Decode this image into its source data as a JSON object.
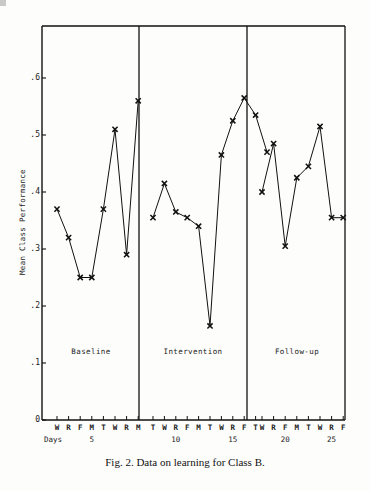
{
  "figure": {
    "caption": "Fig. 2.  Data on learning for Class B.",
    "y_axis_title": "Mean Class Performance",
    "days_label": "Days"
  },
  "chart_data": {
    "type": "line",
    "title": "",
    "xlabel": "Days",
    "ylabel": "Mean Class Performance",
    "ylim": [
      0,
      0.65
    ],
    "yticks": [
      "0",
      ".1",
      ".2",
      ".3",
      ".4",
      ".5",
      ".6"
    ],
    "ytick_values": [
      0,
      0.1,
      0.2,
      0.3,
      0.4,
      0.5,
      0.6
    ],
    "grid": false,
    "legend": "none",
    "marker": "x",
    "phases": [
      {
        "name": "Baseline",
        "xtick_letters": [
          "W",
          "R",
          "F",
          "M",
          "T",
          "W",
          "R",
          "M"
        ],
        "xtick_numbers": [
          {
            "label": "5",
            "index": 3
          }
        ],
        "x": [
          1,
          2,
          3,
          4,
          5,
          6,
          7,
          8
        ],
        "values": [
          0.37,
          0.32,
          0.25,
          0.25,
          0.37,
          0.51,
          0.29,
          0.56
        ]
      },
      {
        "name": "Intervention",
        "xtick_letters": [
          "T",
          "W",
          "R",
          "F",
          "M",
          "T",
          "W",
          "R",
          "F",
          "T"
        ],
        "xtick_numbers": [
          {
            "label": "10",
            "index": 2
          },
          {
            "label": "15",
            "index": 7
          }
        ],
        "x": [
          9,
          10,
          11,
          12,
          13,
          14,
          15,
          16,
          17,
          18
        ],
        "values": [
          0.355,
          0.415,
          0.365,
          0.355,
          0.34,
          0.165,
          0.465,
          0.525,
          0.565,
          0.535
        ]
      },
      {
        "name": "Follow-up",
        "xtick_letters": [
          "W",
          "R",
          "F",
          "M",
          "T",
          "W",
          "R",
          "F"
        ],
        "xtick_numbers": [
          {
            "label": "20",
            "index": 2
          },
          {
            "label": "25",
            "index": 6
          }
        ],
        "x": [
          19,
          20,
          21,
          22,
          23,
          24,
          25,
          26
        ],
        "values": [
          0.4,
          0.485,
          0.305,
          0.425,
          0.445,
          0.515,
          0.355,
          0.355
        ]
      }
    ],
    "extra_points": [
      {
        "phase": "Intervention",
        "note": "terminal point after last labeled tick",
        "value": 0.47
      }
    ],
    "colors": {
      "line": "#111111",
      "axis": "#111111",
      "background": "#fdfdfc"
    }
  }
}
